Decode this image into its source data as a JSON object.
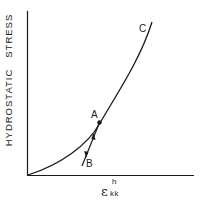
{
  "diagram": {
    "y_axis_label": "HYDROSTATIC   STRESS",
    "x_axis_label": {
      "symbol": "ε",
      "superscript": "h",
      "subscript": "kk"
    },
    "points": {
      "A": "A",
      "B": "B",
      "C": "C"
    },
    "colors": {
      "line": "#1a1a1a",
      "background": "#ffffff"
    }
  }
}
